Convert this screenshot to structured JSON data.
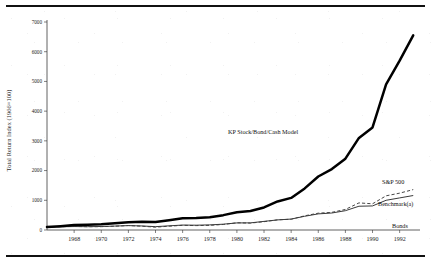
{
  "figure": {
    "top_rule": "horizontal-rule",
    "bottom_rule": "horizontal-rule"
  },
  "axes": {
    "ylabel": "Total Return Index (1966=100)",
    "xlabel": "",
    "ytick_labels": [
      "0",
      "1000",
      "2000",
      "3000",
      "4000",
      "5000",
      "6000",
      "7000"
    ],
    "xtick_labels": [
      "1968",
      "1970",
      "1972",
      "1974",
      "1976",
      "1978",
      "1980",
      "1982",
      "1984",
      "1986",
      "1988",
      "1990",
      "1992"
    ]
  },
  "annotations": {
    "kp_model": "KP Stock/Bond/Cash Model",
    "sp500": "S&P 500",
    "benchmark": "Benchmark(a)",
    "bonds": "Bonds"
  },
  "chart_data": {
    "type": "line",
    "title": "",
    "xlabel": "",
    "ylabel": "Total Return Index (1966=100)",
    "xlim": [
      1966,
      1993.5
    ],
    "ylim": [
      0,
      7000
    ],
    "yticks": [
      0,
      1000,
      2000,
      3000,
      4000,
      5000,
      6000,
      7000
    ],
    "xticks": [
      1968,
      1970,
      1972,
      1974,
      1976,
      1978,
      1980,
      1982,
      1984,
      1986,
      1988,
      1990,
      1992
    ],
    "grid": false,
    "legend": "inline-annotations",
    "x": [
      1966,
      1967,
      1968,
      1969,
      1970,
      1971,
      1972,
      1973,
      1974,
      1975,
      1976,
      1977,
      1978,
      1979,
      1980,
      1981,
      1982,
      1983,
      1984,
      1985,
      1986,
      1987,
      1988,
      1989,
      1990,
      1991,
      1992,
      1993
    ],
    "series": [
      {
        "name": "KP Stock/Bond/Cash Model",
        "style": "thick-solid",
        "color": "#000000",
        "values": [
          100,
          130,
          165,
          180,
          195,
          225,
          260,
          275,
          270,
          330,
          395,
          400,
          430,
          500,
          600,
          640,
          760,
          960,
          1080,
          1400,
          1800,
          2050,
          2400,
          3100,
          3450,
          4900,
          5700,
          6550
        ]
      },
      {
        "name": "S&P 500",
        "style": "dashed",
        "color": "#3c3c3c",
        "values": [
          100,
          112,
          120,
          110,
          112,
          128,
          150,
          128,
          95,
          128,
          158,
          148,
          156,
          186,
          244,
          232,
          280,
          342,
          362,
          478,
          566,
          594,
          692,
          912,
          882,
          1150,
          1240,
          1360
        ]
      },
      {
        "name": "Benchmark(a)",
        "style": "solid",
        "color": "#2e2e2e",
        "values": [
          100,
          108,
          116,
          112,
          118,
          132,
          148,
          136,
          112,
          140,
          166,
          162,
          172,
          196,
          238,
          240,
          290,
          340,
          368,
          462,
          542,
          572,
          650,
          800,
          810,
          1000,
          1080,
          1160
        ]
      },
      {
        "name": "Bonds",
        "style": "dotted",
        "color": "#4a4a4a",
        "values": [
          100,
          100,
          104,
          100,
          112,
          128,
          136,
          138,
          140,
          154,
          176,
          180,
          178,
          180,
          182,
          190,
          260,
          282,
          318,
          390,
          452,
          456,
          500,
          560,
          600,
          690,
          740,
          800
        ]
      }
    ]
  }
}
